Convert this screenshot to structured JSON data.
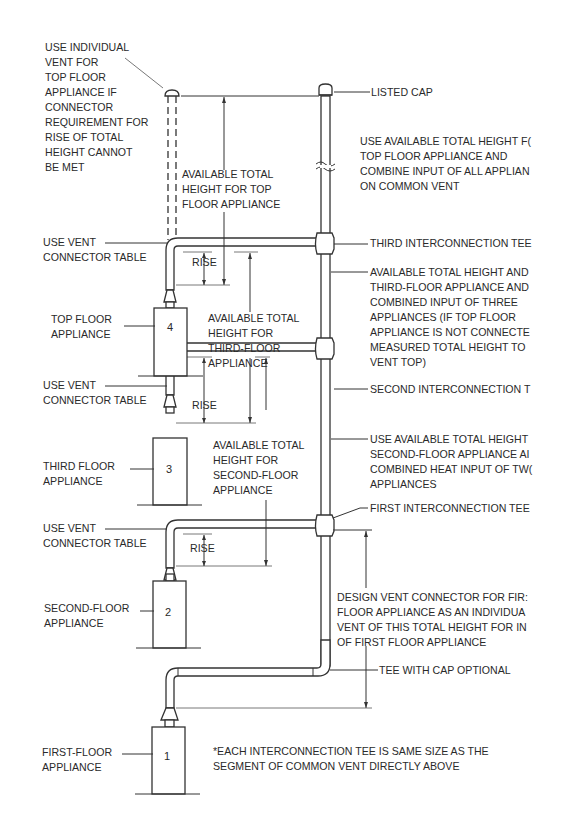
{
  "diagram": {
    "appliances": [
      {
        "number": "4",
        "label": [
          "TOP FLOOR",
          "APPLIANCE"
        ]
      },
      {
        "number": "3",
        "label": [
          "THIRD FLOOR",
          "APPLIANCE"
        ]
      },
      {
        "number": "2",
        "label": [
          "SECOND-FLOOR",
          "APPLIANCE"
        ]
      },
      {
        "number": "1",
        "label": [
          "FIRST-FLOOR",
          "APPLIANCE"
        ]
      }
    ],
    "individual_vent_note": [
      "USE INDIVIDUAL",
      "VENT FOR",
      "TOP FLOOR",
      "APPLIANCE IF",
      "CONNECTOR",
      "REQUIREMENT FOR",
      "RISE OF TOTAL",
      "HEIGHT CANNOT",
      "BE MET"
    ],
    "connector_table_label": [
      "USE VENT",
      "CONNECTOR TABLE"
    ],
    "rise_label": "RISE",
    "height_top": [
      "AVAILABLE TOTAL",
      "HEIGHT FOR TOP",
      "FLOOR APPLIANCE"
    ],
    "height_third": [
      "AVAILABLE TOTAL",
      "HEIGHT FOR",
      "THIRD-FLOOR",
      "APPLIANCE"
    ],
    "height_second": [
      "AVAILABLE TOTAL",
      "HEIGHT FOR",
      "SECOND-FLOOR",
      "APPLIANCE"
    ],
    "listed_cap": "LISTED CAP",
    "top_note": [
      "USE AVAILABLE TOTAL HEIGHT F(",
      "TOP FLOOR APPLIANCE AND",
      "COMBINE INPUT OF ALL APPLIAN",
      "ON COMMON VENT"
    ],
    "third_tee": "THIRD INTERCONNECTION TEE",
    "third_note": [
      "AVAILABLE TOTAL HEIGHT AND",
      "THIRD-FLOOR APPLIANCE AND",
      "COMBINED INPUT OF THREE",
      "APPLIANCES (IF TOP FLOOR",
      "APPLIANCE IS NOT CONNECTE",
      "MEASURED TOTAL HEIGHT TO",
      "VENT TOP)"
    ],
    "second_tee": "SECOND INTERCONNECTION T",
    "second_note": [
      "USE AVAILABLE TOTAL HEIGHT",
      "SECOND-FLOOR APPLIANCE AI",
      "COMBINED HEAT INPUT OF TW(",
      "APPLIANCES"
    ],
    "first_tee": "FIRST INTERCONNECTION TEE",
    "first_note": [
      "DESIGN VENT CONNECTOR FOR FIR:",
      "FLOOR APPLIANCE AS AN INDIVIDUA",
      "VENT OF THIS TOTAL HEIGHT FOR IN",
      "OF FIRST FLOOR APPLIANCE"
    ],
    "tee_cap": "TEE WITH CAP OPTIONAL",
    "footnote": [
      "*EACH INTERCONNECTION TEE IS SAME SIZE AS THE",
      "SEGMENT OF COMMON VENT DIRECTLY ABOVE"
    ]
  }
}
